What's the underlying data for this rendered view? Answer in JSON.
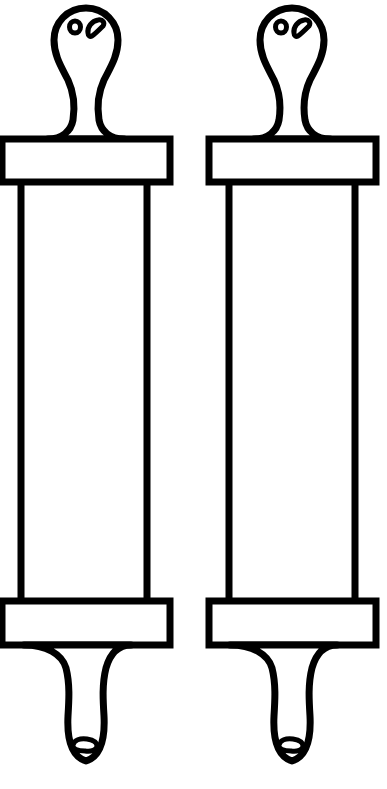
{
  "image": {
    "title": "Line drawing of two rolling pins",
    "width": 387,
    "height": 789,
    "background_color": "#ffffff",
    "stroke_color": "#000000",
    "fill_color": "#ffffff",
    "style": "black outline line art, no shading, no text labels",
    "subject_count": 2,
    "alt_text": "Two identical outlined rolling pin shapes side by side, each with a bulbous knob handle at top and bottom, rectangular collars, and a long straight barrel between them."
  },
  "objects": [
    {
      "id": "rolling-pin-left",
      "label": "rolling-pin-left",
      "clipped_at_left_edge": true,
      "parts": {
        "top_knob": "bulbous finial handle",
        "top_collar": "rectangular band",
        "barrel": "long vertical cylinder drawn as two parallel lines",
        "bottom_collar": "rectangular band",
        "bottom_knob": "tapered rounded handle"
      },
      "markings": {
        "top": [
          "small-circle",
          "curved-bean"
        ],
        "bottom": [
          "small-bean"
        ]
      }
    },
    {
      "id": "rolling-pin-right",
      "label": "rolling-pin-right",
      "clipped_at_left_edge": false,
      "parts": {
        "top_knob": "bulbous finial handle",
        "top_collar": "rectangular band",
        "barrel": "long vertical cylinder drawn as two parallel lines",
        "bottom_collar": "rectangular band",
        "bottom_knob": "tapered rounded handle"
      },
      "markings": {
        "top": [
          "small-circle",
          "curved-bean"
        ],
        "bottom": [
          "small-bean"
        ]
      }
    }
  ],
  "geometry": {
    "left_object_center_x": 86,
    "right_object_center_x": 292,
    "top_collar_top_y": 136,
    "top_collar_bottom_y": 182,
    "bottom_collar_top_y": 601,
    "bottom_collar_bottom_y": 645,
    "barrel_top_y": 182,
    "barrel_bottom_y": 601
  }
}
